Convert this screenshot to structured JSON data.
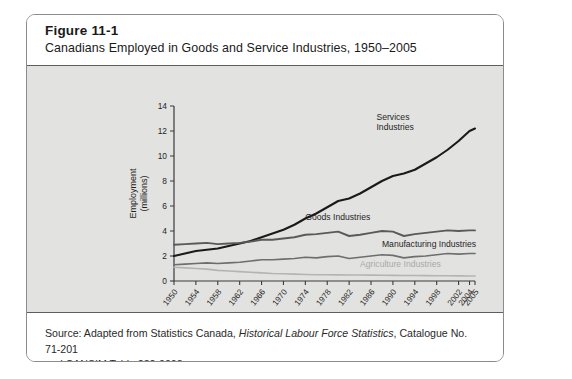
{
  "figure": {
    "number": "Figure 11-1",
    "title": "Canadians Employed in Goods and Service Industries, 1950–2005"
  },
  "source": {
    "line1_prefix": "Source: Adapted from Statistics Canada, ",
    "line1_italic": "Historical Labour Force Statistics",
    "line1_suffix": ", Catalogue No. 71-201",
    "line2": "and CANSIM Table 282-0008."
  },
  "chart_data": {
    "type": "line",
    "title": "Canadians Employed in Goods and Service Industries, 1950–2005",
    "xlabel": "Year",
    "ylabel": "Employment\n(millions)",
    "ylabel_line1": "Employment",
    "ylabel_line2": "(millions)",
    "ylim": [
      0,
      14
    ],
    "yticks": [
      0,
      2,
      4,
      6,
      8,
      10,
      12,
      14
    ],
    "xlim": [
      1950,
      2005
    ],
    "xticks": [
      1950,
      1954,
      1958,
      1962,
      1966,
      1970,
      1974,
      1978,
      1982,
      1986,
      1990,
      1994,
      1998,
      2002,
      2004,
      2005
    ],
    "xtick_labels": [
      "1950",
      "1954",
      "1958",
      "1962",
      "1966",
      "1970",
      "1974",
      "1978",
      "1982",
      "1986",
      "1990",
      "1994",
      "1998",
      "2002",
      "2004",
      "2005"
    ],
    "grid": false,
    "legend_position": "inline-annotations",
    "x": [
      1950,
      1952,
      1954,
      1956,
      1958,
      1960,
      1962,
      1964,
      1966,
      1968,
      1970,
      1972,
      1974,
      1976,
      1978,
      1980,
      1982,
      1984,
      1986,
      1988,
      1990,
      1992,
      1994,
      1996,
      1998,
      2000,
      2002,
      2004,
      2005
    ],
    "series": [
      {
        "name": "Services Industries",
        "color": "#1a1a1a",
        "width": 2.1,
        "label_x": 1987,
        "label_y": 12.9,
        "values": [
          2.0,
          2.2,
          2.4,
          2.5,
          2.6,
          2.8,
          3.0,
          3.2,
          3.5,
          3.8,
          4.1,
          4.5,
          5.0,
          5.4,
          5.9,
          6.4,
          6.6,
          7.0,
          7.5,
          8.0,
          8.4,
          8.6,
          8.9,
          9.4,
          9.9,
          10.5,
          11.2,
          12.0,
          12.2
        ]
      },
      {
        "name": "Goods Industries",
        "color": "#5a5a5a",
        "width": 1.9,
        "label_x": 1974,
        "label_y": 4.9,
        "values": [
          2.9,
          2.95,
          3.0,
          3.05,
          2.95,
          3.0,
          3.05,
          3.15,
          3.3,
          3.3,
          3.4,
          3.5,
          3.7,
          3.75,
          3.85,
          3.95,
          3.6,
          3.7,
          3.85,
          4.0,
          3.95,
          3.6,
          3.75,
          3.85,
          3.95,
          4.05,
          4.0,
          4.05,
          4.05
        ]
      },
      {
        "name": "Manufacturing Industries",
        "color": "#6e6e6e",
        "width": 1.7,
        "label_x": 1988,
        "label_y": 2.75,
        "values": [
          1.3,
          1.35,
          1.4,
          1.45,
          1.4,
          1.45,
          1.5,
          1.6,
          1.7,
          1.7,
          1.75,
          1.8,
          1.9,
          1.85,
          1.95,
          2.0,
          1.8,
          1.9,
          2.0,
          2.1,
          2.05,
          1.85,
          1.95,
          2.0,
          2.1,
          2.2,
          2.15,
          2.2,
          2.2
        ]
      },
      {
        "name": "Agriculture Industries",
        "color": "#b4b4b4",
        "width": 1.7,
        "label_x": 1984,
        "label_y": 1.1,
        "values": [
          1.1,
          1.05,
          1.0,
          0.95,
          0.85,
          0.8,
          0.75,
          0.7,
          0.65,
          0.6,
          0.58,
          0.55,
          0.52,
          0.5,
          0.5,
          0.49,
          0.48,
          0.48,
          0.47,
          0.46,
          0.45,
          0.44,
          0.44,
          0.43,
          0.42,
          0.42,
          0.41,
          0.4,
          0.4
        ]
      }
    ]
  }
}
